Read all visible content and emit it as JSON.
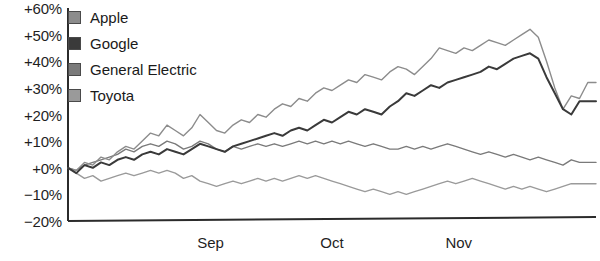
{
  "chart_data": {
    "type": "line",
    "title": "",
    "xlabel": "",
    "ylabel": "",
    "ylim": [
      -20,
      60
    ],
    "ytick_labels": [
      "+60%",
      "+50%",
      "+40%",
      "+30%",
      "+20%",
      "+10%",
      "+0%",
      "−10%",
      "−20%"
    ],
    "ytick_values": [
      60,
      50,
      40,
      30,
      20,
      10,
      0,
      -10,
      -20
    ],
    "xtick_labels": [
      "Sep",
      "Oct",
      "Nov"
    ],
    "xtick_positions": [
      0.27,
      0.5,
      0.74
    ],
    "grid": false,
    "legend_position": "top-left",
    "legend": [
      "Apple",
      "Google",
      "General Electric",
      "Toyota"
    ],
    "colors": {
      "Apple": "#8c8c8c",
      "Google": "#3a3a3a",
      "General Electric": "#7a7a7a",
      "Toyota": "#9a9a9a",
      "axis": "#2b2b2b",
      "text": "#1a1a1a"
    },
    "series": [
      {
        "name": "Apple",
        "values": [
          0,
          -1,
          2,
          1,
          4,
          3,
          6,
          8,
          7,
          10,
          13,
          12,
          16,
          14,
          12,
          15,
          20,
          17,
          14,
          13,
          16,
          18,
          17,
          20,
          19,
          22,
          24,
          23,
          26,
          25,
          28,
          30,
          29,
          31,
          33,
          32,
          35,
          34,
          33,
          36,
          38,
          37,
          35,
          38,
          41,
          45,
          44,
          43,
          45,
          44,
          46,
          48,
          47,
          46,
          48,
          50,
          52,
          49,
          40,
          30,
          22,
          27,
          26,
          32,
          32
        ]
      },
      {
        "name": "Google",
        "values": [
          0,
          -2,
          1,
          0,
          2,
          1,
          3,
          4,
          3,
          5,
          6,
          5,
          7,
          6,
          5,
          7,
          9,
          8,
          7,
          6,
          8,
          9,
          10,
          11,
          12,
          13,
          12,
          14,
          15,
          14,
          16,
          18,
          17,
          19,
          21,
          20,
          22,
          21,
          20,
          23,
          25,
          28,
          27,
          29,
          31,
          30,
          32,
          33,
          34,
          35,
          36,
          38,
          37,
          39,
          41,
          42,
          43,
          41,
          34,
          28,
          22,
          20,
          25,
          25,
          25
        ]
      },
      {
        "name": "General Electric",
        "values": [
          0,
          -1,
          1,
          2,
          3,
          4,
          5,
          7,
          6,
          8,
          9,
          8,
          10,
          9,
          7,
          8,
          10,
          9,
          7,
          6,
          8,
          7,
          8,
          9,
          8,
          9,
          8,
          9,
          10,
          9,
          10,
          9,
          10,
          9,
          10,
          9,
          8,
          9,
          8,
          7,
          7,
          8,
          7,
          8,
          7,
          8,
          9,
          8,
          7,
          6,
          5,
          6,
          5,
          4,
          5,
          4,
          3,
          4,
          3,
          2,
          1,
          3,
          2,
          2,
          2
        ]
      },
      {
        "name": "Toyota",
        "values": [
          0,
          -2,
          -4,
          -3,
          -5,
          -4,
          -3,
          -2,
          -3,
          -2,
          -1,
          -2,
          -1,
          -2,
          -4,
          -3,
          -5,
          -6,
          -7,
          -6,
          -5,
          -6,
          -5,
          -4,
          -5,
          -4,
          -5,
          -4,
          -3,
          -4,
          -3,
          -4,
          -5,
          -6,
          -7,
          -8,
          -9,
          -8,
          -9,
          -10,
          -9,
          -10,
          -9,
          -8,
          -7,
          -6,
          -5,
          -6,
          -5,
          -4,
          -5,
          -6,
          -7,
          -8,
          -7,
          -8,
          -7,
          -8,
          -9,
          -8,
          -7,
          -6,
          -6,
          -6,
          -6
        ]
      }
    ]
  }
}
